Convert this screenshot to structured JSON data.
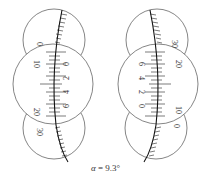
{
  "figure": {
    "caption": {
      "symbol": "α",
      "equals": " = ",
      "value": "9.3°"
    },
    "left_reading": {
      "top_scale_labels": [
        "0"
      ],
      "middle_left_labels": [
        "10",
        "20"
      ],
      "middle_right_labels": [
        "0",
        "2",
        "4",
        "6"
      ],
      "bottom_scale_labels": [
        "30"
      ]
    },
    "right_reading": {
      "top_scale_labels": [
        "30"
      ],
      "middle_left_labels": [
        "6",
        "4",
        "2",
        "0"
      ],
      "middle_right_labels": [
        "20",
        "10"
      ],
      "bottom_scale_labels": [
        "0"
      ]
    },
    "colors": {
      "line": "#555555",
      "index_line": "#111111",
      "text": "#333333",
      "background": "#ffffff"
    }
  }
}
